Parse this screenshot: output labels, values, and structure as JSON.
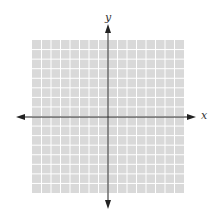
{
  "diagram": {
    "type": "coordinate-plane",
    "x_axis_label": "x",
    "y_axis_label": "y",
    "grid": {
      "columns": 16,
      "rows": 16,
      "fill_color": "#d9d9d9",
      "line_color": "#ffffff"
    },
    "axis_color": "#222222"
  }
}
